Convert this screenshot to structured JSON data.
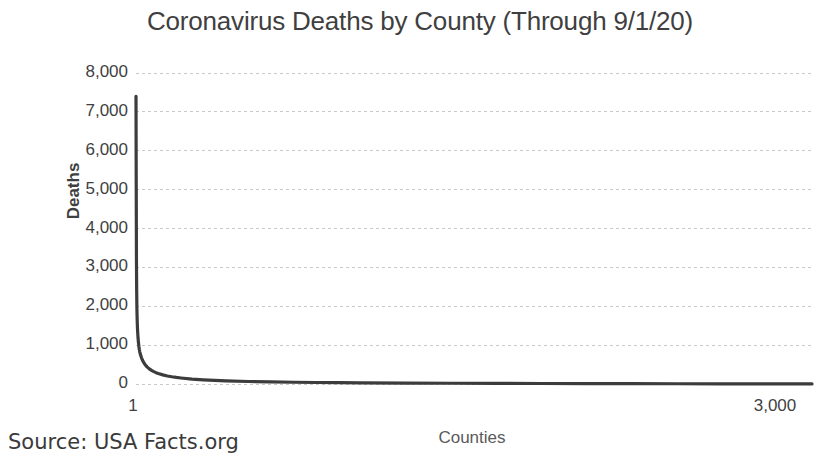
{
  "chart_data": {
    "type": "line",
    "title": "Coronavirus Deaths by County (Through 9/1/20)",
    "xlabel": "Counties",
    "ylabel": "Deaths",
    "source": "Source: USA Facts.org",
    "grid": true,
    "legend": "none",
    "series_color": "#3c3c3c",
    "gridline_color": "#c9c9c9",
    "text_color": "#3f3f3f",
    "xlim": [
      1,
      3000
    ],
    "ylim": [
      0,
      8000
    ],
    "x_tick_labels": [
      "1",
      "3,000"
    ],
    "x_tick_values": [
      1,
      3000
    ],
    "y_tick_labels": [
      "0",
      "1,000",
      "2,000",
      "3,000",
      "4,000",
      "5,000",
      "6,000",
      "7,000",
      "8,000"
    ],
    "y_tick_values": [
      0,
      1000,
      2000,
      3000,
      4000,
      5000,
      6000,
      7000,
      8000
    ],
    "x": [
      1,
      2,
      3,
      4,
      5,
      6,
      7,
      8,
      9,
      10,
      12,
      14,
      16,
      18,
      20,
      25,
      30,
      35,
      40,
      50,
      60,
      70,
      80,
      90,
      100,
      120,
      140,
      160,
      180,
      200,
      250,
      300,
      350,
      400,
      500,
      600,
      700,
      800,
      900,
      1000,
      1200,
      1400,
      1600,
      1800,
      2000,
      2200,
      2400,
      2600,
      2800,
      3000
    ],
    "y": [
      7400,
      5100,
      3200,
      2400,
      1950,
      1700,
      1500,
      1380,
      1280,
      1190,
      1060,
      960,
      880,
      820,
      770,
      680,
      610,
      555,
      510,
      440,
      390,
      350,
      318,
      292,
      270,
      234,
      207,
      186,
      169,
      155,
      126,
      106,
      92,
      81,
      64,
      53,
      45,
      38,
      33,
      29,
      23,
      19,
      15,
      13,
      11,
      9,
      7,
      5,
      3,
      1
    ]
  },
  "plot_geometry": {
    "left": 136,
    "right": 812,
    "top": 73,
    "bottom": 384
  },
  "labels": {
    "y_tick_right_edge": 128,
    "x_first_label_x": 133,
    "x_last_label_x": 775
  }
}
